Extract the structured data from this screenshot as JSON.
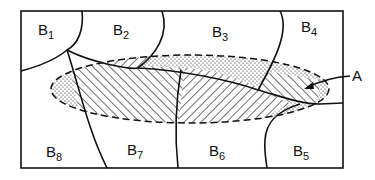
{
  "diagram": {
    "type": "region-overlap schematic",
    "frame": {
      "x": 21,
      "y": 11,
      "width": 322,
      "height": 157
    },
    "regions": [
      {
        "id": "B1",
        "base": "B",
        "sub": "1",
        "x": 38,
        "y": 35
      },
      {
        "id": "B2",
        "base": "B",
        "sub": "2",
        "x": 113,
        "y": 35
      },
      {
        "id": "B3",
        "base": "B",
        "sub": "3",
        "x": 212,
        "y": 37
      },
      {
        "id": "B4",
        "base": "B",
        "sub": "4",
        "x": 301,
        "y": 32
      },
      {
        "id": "B5",
        "base": "B",
        "sub": "5",
        "x": 293,
        "y": 156
      },
      {
        "id": "B6",
        "base": "B",
        "sub": "6",
        "x": 209,
        "y": 156
      },
      {
        "id": "B7",
        "base": "B",
        "sub": "7",
        "x": 127,
        "y": 155
      },
      {
        "id": "B8",
        "base": "B",
        "sub": "8",
        "x": 46,
        "y": 157
      }
    ],
    "overlay": {
      "label": "A",
      "shape": "dashed ellipse",
      "fill_patterns": [
        "diagonal hatching",
        "stipple dots"
      ]
    },
    "colors": {
      "stroke": "#111111",
      "background": "#ffffff"
    }
  }
}
